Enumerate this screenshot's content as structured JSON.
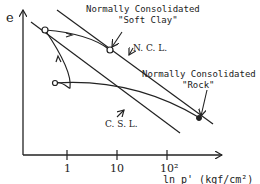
{
  "diagram": {
    "y_axis_label": "e",
    "x_axis_label": "ln p' (kgf/cm²)",
    "x_ticks": [
      "1",
      "10",
      "10²"
    ],
    "lines": [
      {
        "name": "N.C.L.",
        "label": "N. C. L."
      },
      {
        "name": "C.S.L.",
        "label": "C. S. L."
      }
    ],
    "annotations": {
      "soft_clay_line1": "Normally Consolidated",
      "soft_clay_line2": "\"Soft Clay\"",
      "rock_line1": "Normally Consolidated",
      "rock_line2": "\"Rock\""
    },
    "colors": {
      "ink": "#222222",
      "background": "#ffffff"
    }
  }
}
